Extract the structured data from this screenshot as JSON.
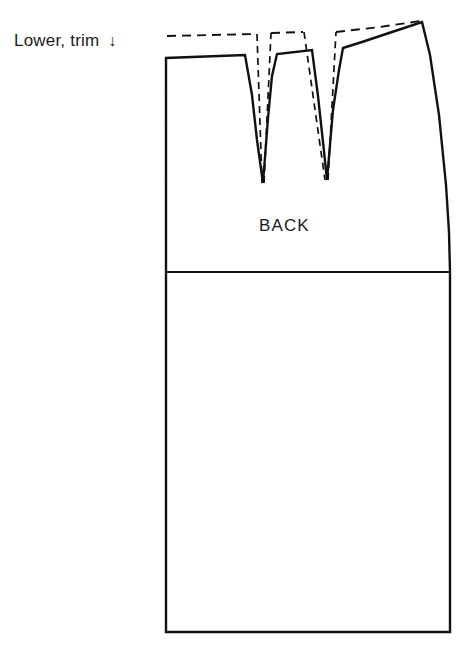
{
  "figure": {
    "kind": "sewing-pattern-diagram",
    "garment_piece_label": "BACK",
    "instruction_label": "Lower, trim",
    "instruction_arrow_glyph": "↓",
    "background_color": "#ffffff",
    "line_color": "#111111",
    "solid_line_label": "new lowered waistline",
    "dashed_line_label": "original waistline",
    "faint_top_artifact": ""
  },
  "geometry": {
    "stroke_width_outline": 2.4,
    "stroke_width_dash": 1.9,
    "dash_pattern": "9,6",
    "left_edge_x": 166,
    "right_edge_top_x": 422,
    "right_edge_hip_x": 450,
    "hip_line_y": 272,
    "hem_line_y": 632,
    "hem_left_x": 164,
    "hem_right_x": 449,
    "waist_solid_left_y": 58,
    "waist_dashed_left_y": 35,
    "dart1_tip": [
      263,
      183
    ],
    "dart2_tip": [
      327,
      180
    ],
    "top_right_corner": [
      422,
      22
    ],
    "paths": {
      "outline_solid": "M 166 632 L 166 58 L 246 55 L 263 183 L 277 54 L 312 50 L 327 180 L 343 48 L 362 42 L 422 22 L 432 60 L 442 130 L 448 205 L 450 272 L 450 632 Z",
      "hip_line": "M 166 272 L 450 272",
      "dashed_waist": "M 167 36 L 255 34 M 256 34 L 256 57 M 264 183 L 256 57 M 264 183 L 271 34 M 271 34 L 302 33 M 302 33 L 302 52 M 327 180 L 302 52 M 327 180 L 335 33 M 335 33 L 345 31 M 345 31 L 345 50 M 345 31 L 420 22"
    }
  }
}
